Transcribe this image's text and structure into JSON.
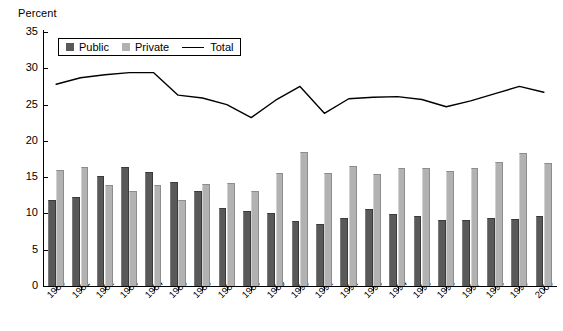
{
  "chart_data": {
    "type": "bar",
    "title": "",
    "ylabel": "Percent",
    "xlabel": "",
    "ylim": [
      0,
      35
    ],
    "yticks": [
      0,
      5,
      10,
      15,
      20,
      25,
      30,
      35
    ],
    "grid": false,
    "legend_position": "top-left",
    "categories": [
      "1980",
      "1981",
      "1982",
      "1983",
      "1984",
      "1985",
      "1986",
      "1987",
      "1988",
      "1989",
      "1990",
      "1991",
      "1992",
      "1993",
      "1994",
      "1995",
      "1996",
      "1997",
      "1998",
      "1999",
      "2000"
    ],
    "series": [
      {
        "name": "Public",
        "type": "bar",
        "color": "#595959",
        "values": [
          11.8,
          12.3,
          15.2,
          16.4,
          15.7,
          14.4,
          13.1,
          10.8,
          10.4,
          10.0,
          8.9,
          8.5,
          9.4,
          10.6,
          9.9,
          9.6,
          9.1,
          9.1,
          9.4,
          9.2,
          9.7
        ]
      },
      {
        "name": "Private",
        "type": "bar",
        "color": "#b2b2b2",
        "values": [
          16.0,
          16.4,
          13.9,
          13.1,
          13.9,
          11.9,
          14.0,
          14.2,
          13.1,
          15.6,
          18.5,
          15.6,
          16.6,
          15.5,
          16.3,
          16.2,
          15.9,
          16.2,
          17.1,
          18.3,
          17.0
        ]
      },
      {
        "name": "Total",
        "type": "line",
        "color": "#000000",
        "values": [
          27.8,
          28.7,
          29.1,
          29.4,
          29.4,
          26.3,
          25.9,
          25.0,
          23.2,
          25.6,
          27.5,
          23.8,
          25.8,
          26.0,
          26.1,
          25.7,
          24.7,
          25.5,
          26.5,
          27.5,
          26.7
        ]
      }
    ],
    "legend": [
      "Public",
      "Private",
      "Total"
    ]
  }
}
